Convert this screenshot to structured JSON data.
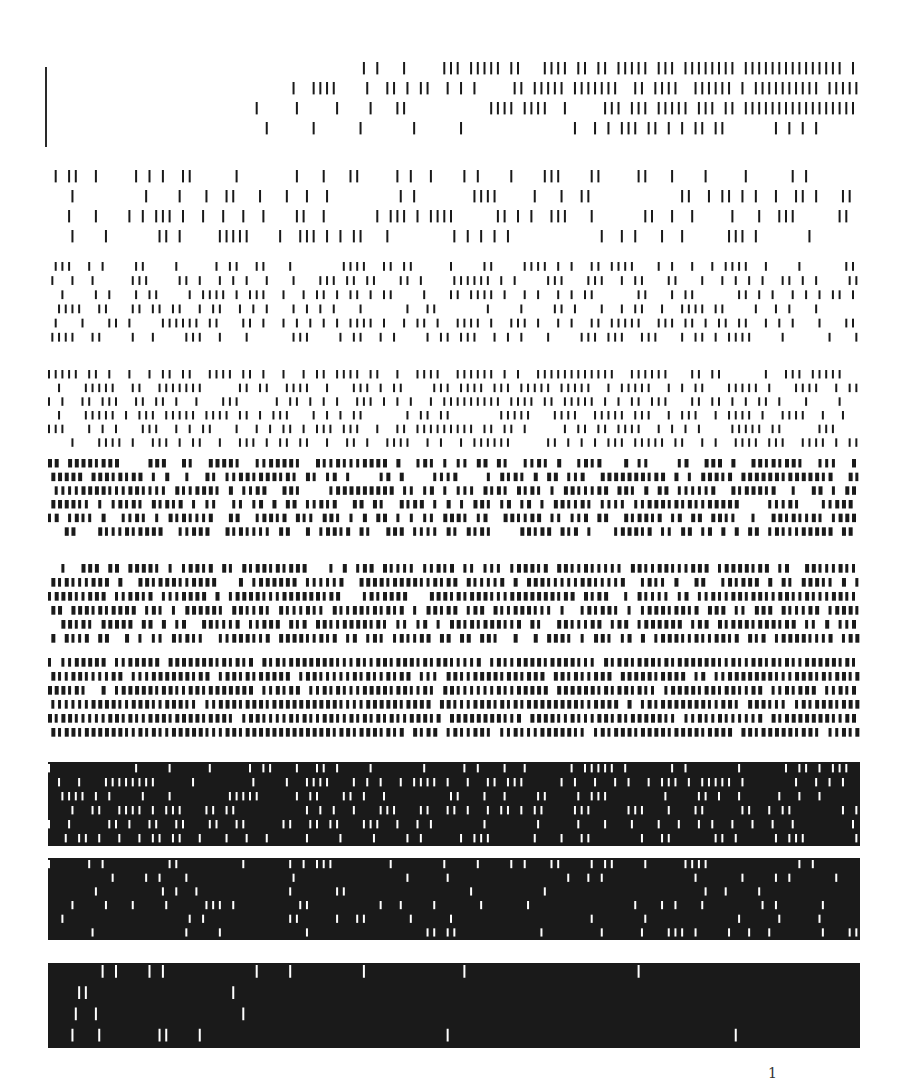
{
  "page": {
    "background": "#ffffff",
    "ink": "#1a1a1a",
    "page_mark": "1"
  },
  "bands": [
    {
      "name": "band-01-sparse",
      "top": 60,
      "height": 80,
      "rows": 4,
      "density": 0.06,
      "mode": "marks"
    },
    {
      "name": "band-02",
      "top": 168,
      "height": 80,
      "rows": 4,
      "density": 0.22,
      "mode": "marks"
    },
    {
      "name": "band-03",
      "top": 260,
      "height": 85,
      "rows": 6,
      "density": 0.33,
      "mode": "marks"
    },
    {
      "name": "band-04",
      "top": 368,
      "height": 82,
      "rows": 6,
      "density": 0.45,
      "mode": "marks"
    },
    {
      "name": "band-05",
      "top": 457,
      "height": 82,
      "rows": 6,
      "density": 0.55,
      "mode": "marks"
    },
    {
      "name": "band-06",
      "top": 562,
      "height": 84,
      "rows": 6,
      "density": 0.62,
      "mode": "marks"
    },
    {
      "name": "band-07",
      "top": 656,
      "height": 84,
      "rows": 6,
      "density": 0.72,
      "mode": "marks"
    },
    {
      "name": "band-08",
      "top": 762,
      "height": 84,
      "rows": 6,
      "density": 0.8,
      "mode": "gaps"
    },
    {
      "name": "band-09",
      "top": 858,
      "height": 82,
      "rows": 6,
      "density": 0.88,
      "mode": "gaps"
    },
    {
      "name": "band-10-dense",
      "top": 963,
      "height": 85,
      "rows": 4,
      "density": 0.95,
      "mode": "gaps"
    }
  ]
}
